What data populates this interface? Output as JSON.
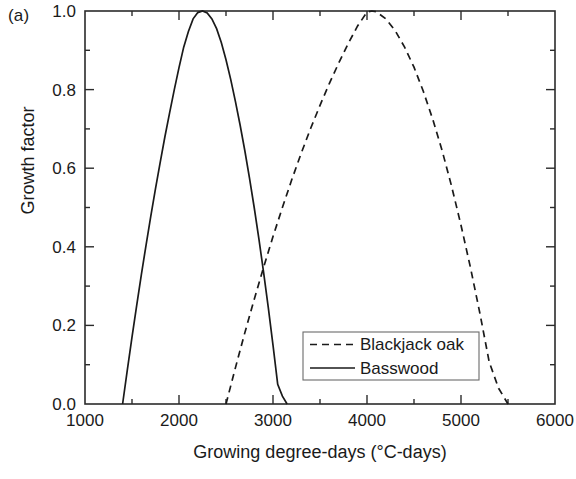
{
  "panel": {
    "label": "(a)"
  },
  "chart_data": {
    "type": "line",
    "title": "",
    "panel_label": "(a)",
    "xlabel": "Growing degree-days (°C-days)",
    "ylabel": "Growth factor",
    "xlim": [
      1000,
      6000
    ],
    "ylim": [
      0.0,
      1.0
    ],
    "x_major_ticks": [
      1000,
      2000,
      3000,
      4000,
      5000,
      6000
    ],
    "x_minor_ticks": [
      1500,
      2500,
      3500,
      4500,
      5500
    ],
    "x_tick_labels": [
      "1000",
      "2000",
      "3000",
      "4000",
      "5000",
      "6000"
    ],
    "y_major_ticks": [
      0.0,
      0.2,
      0.4,
      0.6,
      0.8,
      1.0
    ],
    "y_minor_ticks": [
      0.1,
      0.3,
      0.5,
      0.7,
      0.9
    ],
    "y_tick_labels": [
      "0.0",
      "0.2",
      "0.4",
      "0.6",
      "0.8",
      "1.0"
    ],
    "grid": false,
    "legend_position": "lower-right",
    "annotations": [
      {
        "text": "curves intersect",
        "x": 3050,
        "y": 0.47
      }
    ],
    "series": [
      {
        "name": "Blackjack oak",
        "style": "dashed",
        "color": "#1a1a1a",
        "min_gdd": 2500,
        "opt_gdd": 4050,
        "max_gdd": 5500,
        "peak_value": 1.0,
        "x": [
          2500,
          2600,
          2700,
          2800,
          2900,
          3000,
          3100,
          3200,
          3300,
          3400,
          3500,
          3600,
          3700,
          3800,
          3900,
          4000,
          4050,
          4100,
          4200,
          4300,
          4400,
          4500,
          4600,
          4700,
          4800,
          4900,
          5000,
          5100,
          5200,
          5300,
          5400,
          5500
        ],
        "y": [
          0.0,
          0.092,
          0.181,
          0.266,
          0.348,
          0.426,
          0.5,
          0.571,
          0.638,
          0.701,
          0.76,
          0.816,
          0.868,
          0.917,
          0.962,
          0.997,
          1.0,
          0.998,
          0.98,
          0.95,
          0.908,
          0.857,
          0.795,
          0.724,
          0.644,
          0.554,
          0.455,
          0.348,
          0.232,
          0.107,
          0.04,
          0.0
        ]
      },
      {
        "name": "Basswood",
        "style": "solid",
        "color": "#1a1a1a",
        "min_gdd": 1400,
        "opt_gdd": 2250,
        "max_gdd": 3150,
        "peak_value": 1.0,
        "x": [
          1400,
          1450,
          1500,
          1550,
          1600,
          1650,
          1700,
          1750,
          1800,
          1850,
          1900,
          1950,
          2000,
          2050,
          2100,
          2150,
          2200,
          2250,
          2300,
          2350,
          2400,
          2450,
          2500,
          2550,
          2600,
          2650,
          2700,
          2750,
          2800,
          2850,
          2900,
          2950,
          3000,
          3050,
          3100,
          3150
        ],
        "y": [
          0.0,
          0.086,
          0.17,
          0.251,
          0.33,
          0.405,
          0.478,
          0.548,
          0.615,
          0.68,
          0.741,
          0.8,
          0.856,
          0.908,
          0.948,
          0.98,
          0.996,
          1.0,
          0.995,
          0.98,
          0.955,
          0.92,
          0.876,
          0.826,
          0.77,
          0.71,
          0.645,
          0.575,
          0.5,
          0.42,
          0.335,
          0.245,
          0.15,
          0.05,
          0.02,
          0.0
        ]
      }
    ]
  },
  "legend": {
    "entries": [
      {
        "label": "Blackjack oak",
        "style": "dashed"
      },
      {
        "label": "Basswood",
        "style": "solid"
      }
    ]
  }
}
